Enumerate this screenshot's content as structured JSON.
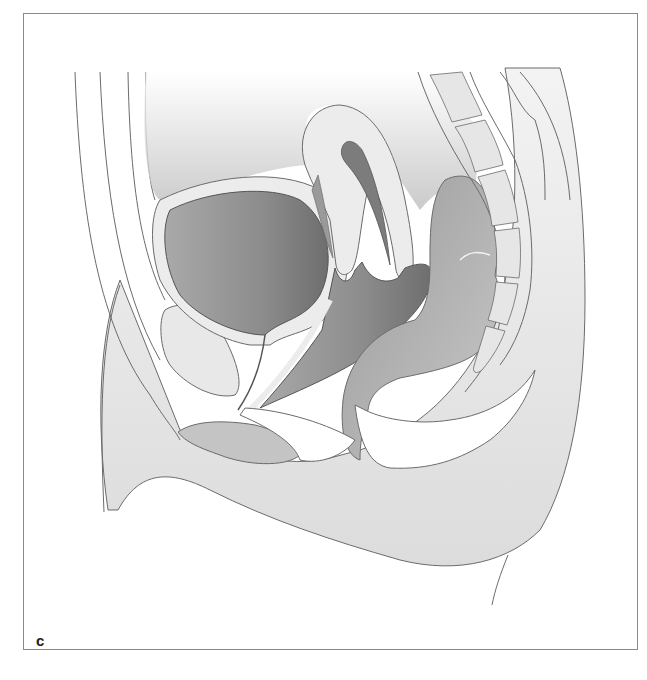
{
  "figure": {
    "panel_label": "c",
    "colors": {
      "outline": "#6b6b6b",
      "dark_fill": "#8f8f8f",
      "mid_fill": "#b5b5b5",
      "light_fill": "#e6e6e6",
      "skin_fill": "#efefef",
      "background": "#ffffff",
      "frame_border": "#8a8a8a"
    }
  }
}
